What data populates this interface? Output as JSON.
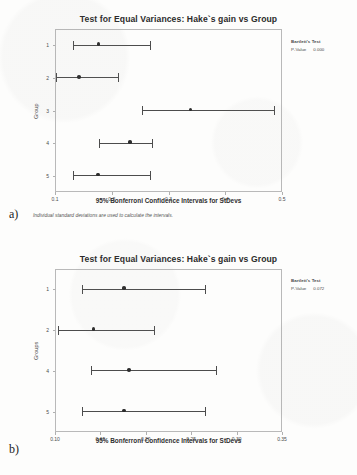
{
  "document": {
    "panel_a_tag": "a)",
    "panel_b_tag": "b)"
  },
  "chart_data": [
    {
      "id": "panel-a",
      "type": "scatter",
      "title": "Test for Equal Variances: Hake`s gain vs Group",
      "xlabel": "95% Bonferroni Confidence Intervals for StDevs",
      "ylabel": "Group",
      "footnote": "Individual standard deviations are used to calculate the intervals.",
      "xlim": [
        0.1,
        0.5
      ],
      "xticks": [
        0.1,
        0.2,
        0.3,
        0.4,
        0.5
      ],
      "xticklabels": [
        "0.1",
        "0.2",
        "0.3",
        "0.4",
        "0.5"
      ],
      "categories": [
        "1",
        "2",
        "3",
        "4",
        "5"
      ],
      "grid": false,
      "annotation": {
        "title": "Bartlett's Test",
        "stat_label": "P-Value",
        "stat_value": "0.000"
      },
      "intervals": [
        {
          "group": "1",
          "lower": 0.131,
          "center": 0.177,
          "upper": 0.269
        },
        {
          "group": "2",
          "lower": 0.101,
          "center": 0.142,
          "upper": 0.213
        },
        {
          "group": "3",
          "lower": 0.254,
          "center": 0.339,
          "upper": 0.487
        },
        {
          "group": "4",
          "lower": 0.177,
          "center": 0.232,
          "upper": 0.272
        },
        {
          "group": "5",
          "lower": 0.131,
          "center": 0.176,
          "upper": 0.269
        }
      ]
    },
    {
      "id": "panel-b",
      "type": "scatter",
      "title": "Test for Equal Variances: Hake`s gain vs Group",
      "xlabel": "95% Bonferroni Confidence Intervals for StDevs",
      "ylabel": "Groups",
      "footnote": "",
      "xlim": [
        0.1,
        0.35
      ],
      "xticks": [
        0.1,
        0.15,
        0.2,
        0.25,
        0.3,
        0.35
      ],
      "xticklabels": [
        "0.10",
        "0.15",
        "0.20",
        "0.25",
        "0.30",
        "0.35"
      ],
      "categories": [
        "1",
        "2",
        "4",
        "5"
      ],
      "grid": false,
      "annotation": {
        "title": "Bartlett's Test",
        "stat_label": "P-Value",
        "stat_value": "0.072"
      },
      "intervals": [
        {
          "group": "1",
          "lower": 0.13,
          "center": 0.176,
          "upper": 0.266
        },
        {
          "group": "2",
          "lower": 0.1035,
          "center": 0.1425,
          "upper": 0.21
        },
        {
          "group": "4",
          "lower": 0.1395,
          "center": 0.1815,
          "upper": 0.2785
        },
        {
          "group": "5",
          "lower": 0.13,
          "center": 0.176,
          "upper": 0.266
        }
      ]
    }
  ]
}
